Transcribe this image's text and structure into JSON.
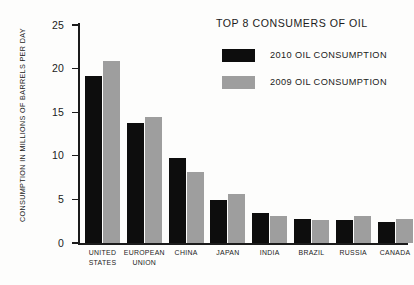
{
  "chart_data": {
    "type": "bar",
    "title": "TOP 8 CONSUMERS OF OIL",
    "xlabel": "",
    "ylabel": "CONSUMPTION IN MILLIONS OF BARRELS PER DAY",
    "ylim": [
      0,
      25
    ],
    "yticks": [
      0,
      5,
      10,
      15,
      20,
      25
    ],
    "ytick_labels": [
      "0",
      "5",
      "10",
      "15",
      "20",
      "25"
    ],
    "grid": false,
    "legend_position": "top-right",
    "categories": [
      "UNITED STATES",
      "EUROPEAN UNION",
      "CHINA",
      "JAPAN",
      "INDIA",
      "BRAZIL",
      "RUSSIA",
      "CANADA"
    ],
    "category_lines": [
      [
        "UNITED",
        "STATES"
      ],
      [
        "EUROPEAN",
        "UNION"
      ],
      [
        "CHINA"
      ],
      [
        "JAPAN"
      ],
      [
        "INDIA"
      ],
      [
        "BRAZIL"
      ],
      [
        "RUSSIA"
      ],
      [
        "CANADA"
      ]
    ],
    "series": [
      {
        "name": "2010 OIL CONSUMPTION",
        "color": "#0d0d0d",
        "values": [
          19.2,
          13.8,
          9.7,
          4.9,
          3.4,
          2.8,
          2.6,
          2.4
        ]
      },
      {
        "name": "2009 OIL CONSUMPTION",
        "color": "#9e9e9e",
        "values": [
          20.9,
          14.5,
          8.2,
          5.6,
          3.1,
          2.6,
          3.1,
          2.8
        ]
      }
    ]
  },
  "legend": {
    "items": [
      {
        "label": "2010 OIL CONSUMPTION",
        "color": "#0d0d0d"
      },
      {
        "label": "2009 OIL CONSUMPTION",
        "color": "#9e9e9e"
      }
    ]
  },
  "colors": {
    "background": "#fdfdfc",
    "axis": "#1b1b1b",
    "series_2010": "#0d0d0d",
    "series_2009": "#9e9e9e"
  }
}
